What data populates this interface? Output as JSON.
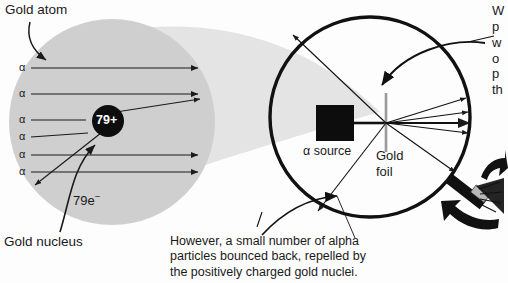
{
  "figure": {
    "type": "rutherford-gold-foil-scattering-diagram",
    "background_color": "#fdfdfd",
    "ink_color": "#1a1a1a"
  },
  "atom_panel": {
    "title_label": "Gold atom",
    "nucleus_label": "79+",
    "nucleus_callout": "Gold nucleus",
    "electron_cloud_label": "79e⁻",
    "electron_count_number": "79",
    "electron_charge_sign": "−",
    "cloud_color": "#cfcfcf",
    "funnel_color": "#e2e2e2",
    "nucleus_color": "#0d0d0d",
    "alpha_ray_labels": [
      "α",
      "α",
      "α",
      "α",
      "α",
      "α"
    ],
    "alpha_ray_count": 6,
    "deflected_ray_count": 2
  },
  "apparatus_panel": {
    "source_label": "α source",
    "foil_label": "Gold\nfoil",
    "foil_color": "#9a9a9a",
    "detector_ring_color": "#111111",
    "source_box_color": "#0d0d0d",
    "forward_ray_count": 5,
    "backscatter_ray_count": 2
  },
  "caption": {
    "text": "However, a small number of alpha\nparticles bounced back, repelled by\nthe positively charged gold nuclei."
  },
  "right_note": {
    "clipped_text": "W\np\nw\no\np\nth"
  }
}
